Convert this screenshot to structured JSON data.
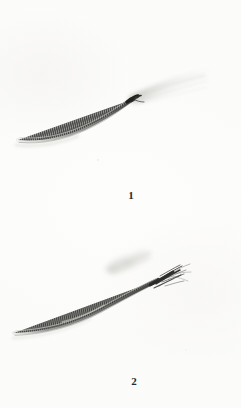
{
  "plate": {
    "width": 241,
    "height": 408,
    "background_color": "#fdfdfc",
    "caption_font_color": "#2b2b2b"
  },
  "figures": [
    {
      "label": "1",
      "label_position": {
        "x": 131,
        "y": 196
      },
      "subject": "segmented-filament-with-pale-plume",
      "shaft_color": "#3a3a38",
      "shaft_highlight_color": "#b9b9b4",
      "plume_color": "#e8e8e5",
      "node_color": "#232321",
      "description_visible_text": ""
    },
    {
      "label": "2",
      "label_position": {
        "x": 134,
        "y": 382
      },
      "subject": "segmented-filament-with-bristled-tip-and-detached-fragment",
      "shaft_color": "#343432",
      "shaft_highlight_color": "#c2c2bd",
      "fragment_color": "#dededb",
      "bristle_color": "#2a2a28",
      "description_visible_text": ""
    }
  ]
}
